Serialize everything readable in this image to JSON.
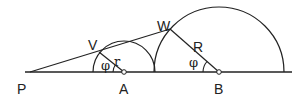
{
  "diagram": {
    "type": "geometry",
    "colors": {
      "stroke": "#222222",
      "background": "#ffffff",
      "point_fill": "#ffffff"
    },
    "baseline": {
      "x1": 25,
      "x2": 292,
      "y": 72
    },
    "points": {
      "P": {
        "label": "P",
        "x": 30,
        "y": 72
      },
      "A": {
        "label": "A",
        "x": 124,
        "y": 72
      },
      "B": {
        "label": "B",
        "x": 219,
        "y": 72
      },
      "V": {
        "label": "V",
        "x": 99,
        "y": 52
      },
      "W": {
        "label": "W",
        "x": 170,
        "y": 29
      }
    },
    "circles": {
      "small": {
        "center": "A",
        "radius": 31
      },
      "large": {
        "center": "B",
        "radius": 65
      }
    },
    "segments": {
      "r": {
        "label": "r"
      },
      "R": {
        "label": "R"
      }
    },
    "angles": {
      "at_A": {
        "label": "φ"
      },
      "at_B": {
        "label": "φ"
      }
    }
  }
}
